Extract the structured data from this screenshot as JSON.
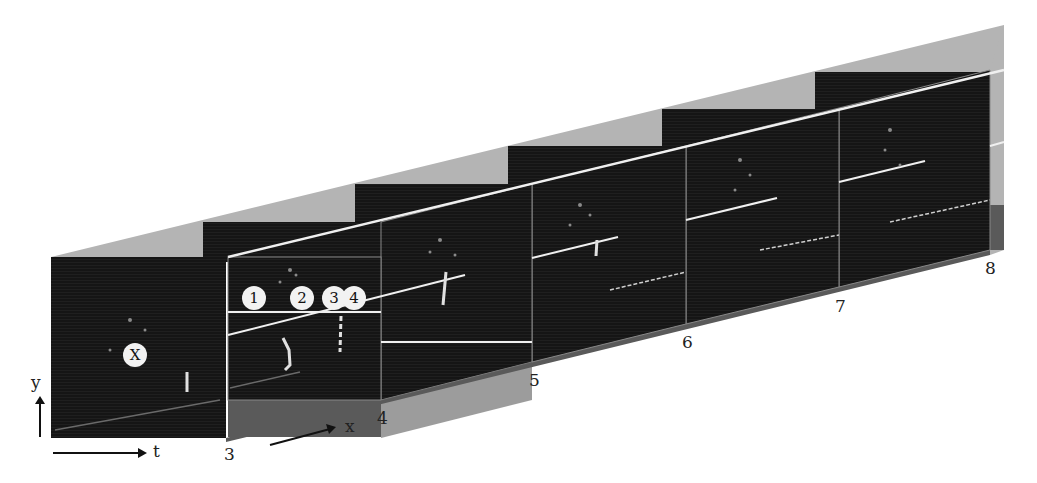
{
  "figure": {
    "axes": {
      "y_label": "y",
      "t_label": "t",
      "x_label": "x"
    },
    "frame_labels": [
      "3",
      "4",
      "5",
      "6",
      "7",
      "8"
    ],
    "markers": {
      "x_marker": "X",
      "points": [
        "1",
        "2",
        "3",
        "4"
      ]
    },
    "colors": {
      "frame_dark": "#151515",
      "side_light": "#b4b4b4",
      "floor_dark": "#5a5a5a",
      "trace_line": "#f0f0f0",
      "text": "#222222"
    }
  }
}
